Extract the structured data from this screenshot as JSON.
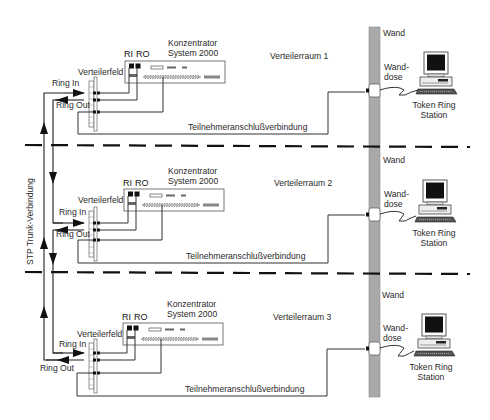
{
  "diagram": {
    "trunk_label": "STP Trunk-Verbindung",
    "wall": {
      "label": "Wand",
      "color": "#a9a9a9"
    },
    "rooms": [
      {
        "name": "Verteilerraum 1",
        "concentrator": {
          "line1": "Konzentrator",
          "line2": "System 2000",
          "port_ri": "RI",
          "port_ro": "RO"
        },
        "patch_panel": "Verteilerfeld",
        "ring_in": "Ring In",
        "ring_out": "Ring Out",
        "link": "Teilnehmeranschlußverbindung",
        "wall_label": "Wand",
        "outlet_line1": "Wand-",
        "outlet_line2": "dose",
        "station_line1": "Token Ring",
        "station_line2": "Station"
      },
      {
        "name": "Verteilerraum 2",
        "concentrator": {
          "line1": "Konzentrator",
          "line2": "System 2000",
          "port_ri": "RI",
          "port_ro": "RO"
        },
        "patch_panel": "Verteilerfeld",
        "ring_in": "Ring In",
        "ring_out": "Ring Out",
        "link": "Teilnehmeranschlußverbindung",
        "wall_label": "Wand",
        "outlet_line1": "Wand-",
        "outlet_line2": "dose",
        "station_line1": "Token Ring",
        "station_line2": "Station"
      },
      {
        "name": "Verteilerraum 3",
        "concentrator": {
          "line1": "Konzentrator",
          "line2": "System 2000",
          "port_ri": "RI",
          "port_ro": "RO"
        },
        "patch_panel": "Verteilerfeld",
        "ring_in": "Ring In",
        "ring_out": "Ring Out",
        "link": "Teilnehmeranschlußverbindung",
        "wall_label": "Wand",
        "outlet_line1": "Wand-",
        "outlet_line2": "dose",
        "station_line1": "Token Ring",
        "station_line2": "Station"
      }
    ]
  }
}
